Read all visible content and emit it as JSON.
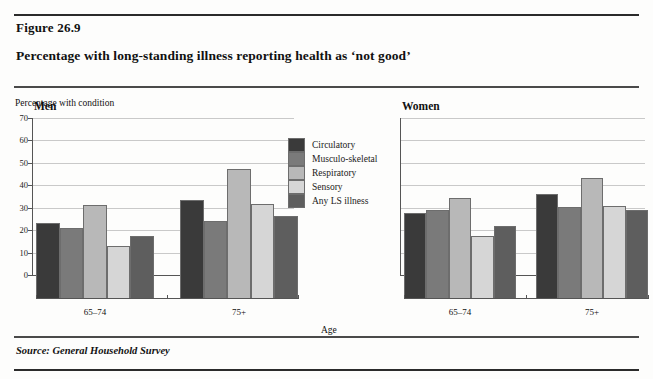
{
  "figure": {
    "number": "Figure 26.9",
    "title": "Percentage with long-standing illness reporting health as ‘not good’",
    "source": "Source: General Household Survey"
  },
  "chart_data": {
    "type": "bar",
    "title": "Percentage with long-standing illness reporting health as ‘not good’",
    "ylabel": "Percentage with condition",
    "xlabel": "Age",
    "ylim": [
      0,
      70
    ],
    "yticks": [
      0,
      10,
      20,
      30,
      40,
      50,
      60,
      70
    ],
    "grid": true,
    "legend_position": "center",
    "panels": [
      {
        "name": "Men",
        "categories": [
          "65–74",
          "75+"
        ],
        "series": [
          {
            "name": "Circulatory",
            "values": [
              34.0,
              44.0
            ]
          },
          {
            "name": "Musculo-skeletal",
            "values": [
              31.5,
              35.0
            ]
          },
          {
            "name": "Respiratory",
            "values": [
              42.0,
              58.0
            ]
          },
          {
            "name": "Sensory",
            "values": [
              23.5,
              42.5
            ]
          },
          {
            "name": "Any LS illness",
            "values": [
              28.0,
              37.0
            ]
          }
        ]
      },
      {
        "name": "Women",
        "categories": [
          "65–74",
          "75+"
        ],
        "series": [
          {
            "name": "Circulatory",
            "values": [
              38.5,
              47.0
            ]
          },
          {
            "name": "Musculo-skeletal",
            "values": [
              39.5,
              41.0
            ]
          },
          {
            "name": "Respiratory",
            "values": [
              45.0,
              54.0
            ]
          },
          {
            "name": "Sensory",
            "values": [
              28.0,
              41.5
            ]
          },
          {
            "name": "Any LS illness",
            "values": [
              32.5,
              39.5
            ]
          }
        ]
      }
    ],
    "colors": {
      "Circulatory": "#3a3a3a",
      "Musculo-skeletal": "#7a7a7a",
      "Respiratory": "#b8b8b8",
      "Sensory": "#d6d6d6",
      "Any LS illness": "#5e5e5e"
    }
  },
  "legend": {
    "items": [
      {
        "label": "Circulatory",
        "color": "#3a3a3a"
      },
      {
        "label": "Musculo-skeletal",
        "color": "#7a7a7a"
      },
      {
        "label": "Respiratory",
        "color": "#b8b8b8"
      },
      {
        "label": "Sensory",
        "color": "#d6d6d6"
      },
      {
        "label": "Any LS illness",
        "color": "#5e5e5e"
      }
    ]
  }
}
